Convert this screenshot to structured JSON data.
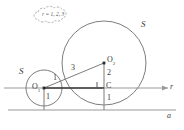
{
  "diagram": {
    "type": "geometry-figure",
    "colors": {
      "stroke_gray": "#8a8a8a",
      "stroke_dark": "#3a3a3a",
      "axis": "#9a9a9a",
      "label": "#3a3a3a",
      "background": "#ffffff"
    },
    "callout": {
      "name": "cloud-annotation",
      "text": "r = 1, 2, 3"
    },
    "axes": {
      "horizontal_axis_label": "r",
      "bottom_line_label": "a"
    },
    "circles": [
      {
        "name": "small-circle",
        "label": "S",
        "center_label": "O",
        "center_subscript": "1",
        "radius_label_above": "1",
        "radius_label_below": "1",
        "cx": 44,
        "cy": 88,
        "r": 18
      },
      {
        "name": "large-circle",
        "label": "S",
        "center_label": "O",
        "center_subscript": "2",
        "radius_label_above": "2",
        "radius_label_below": "1",
        "cx": 104,
        "cy": 63,
        "r": 42
      }
    ],
    "points": [
      {
        "name": "small-center",
        "label": "O",
        "subscript": "1"
      },
      {
        "name": "large-center",
        "label": "O",
        "subscript": "2"
      },
      {
        "name": "foot-point",
        "label": "C",
        "subscript": ""
      }
    ],
    "segments": [
      {
        "name": "hypotenuse",
        "length_label": "3",
        "from": "small-center",
        "to": "large-center"
      },
      {
        "name": "vertical-leg",
        "length_label": "2",
        "from": "large-center",
        "to": "foot-point"
      },
      {
        "name": "horizontal-leg",
        "length_label": "",
        "from": "small-center",
        "to": "foot-point"
      },
      {
        "name": "small-radius-down",
        "length_label": "1",
        "from": "small-center",
        "to": "tangent-point-a"
      },
      {
        "name": "large-radius-down",
        "length_label": "1",
        "from": "foot-point",
        "to": "tangent-point-a2"
      }
    ],
    "markers": [
      {
        "name": "right-angle-marker",
        "at": "foot-point"
      }
    ]
  }
}
